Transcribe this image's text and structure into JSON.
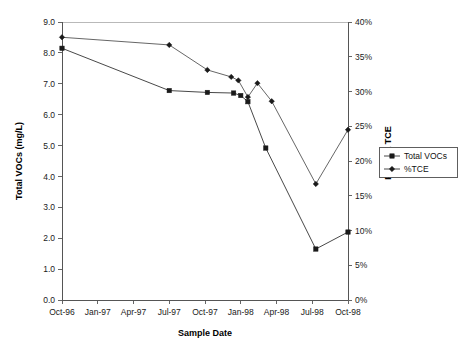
{
  "chart_data": {
    "type": "line",
    "title": "",
    "xlabel": "Sample Date",
    "ylabel": "Total VOCs (mg/L)",
    "y2label": "Percent TCE",
    "grid": "top-border-only",
    "legend_position": "right-outside-middle",
    "x_categories": [
      "Oct-96",
      "Jan-97",
      "Apr-97",
      "Jul-97",
      "Oct-97",
      "Jan-98",
      "Apr-98",
      "Jul-98",
      "Oct-98"
    ],
    "x_tick_labels": [
      "Oct-96",
      "Jan-97",
      "Apr-97",
      "Jul-97",
      "Oct-97",
      "Jan-98",
      "Apr-98",
      "Jul-98",
      "Oct-98"
    ],
    "y_tick_labels": [
      "0.0",
      "1.0",
      "2.0",
      "3.0",
      "4.0",
      "5.0",
      "6.0",
      "7.0",
      "8.0",
      "9.0"
    ],
    "y_tick_values": [
      0.0,
      1.0,
      2.0,
      3.0,
      4.0,
      5.0,
      6.0,
      7.0,
      8.0,
      9.0
    ],
    "ylim": [
      0.0,
      9.0
    ],
    "y2_tick_labels": [
      "0%",
      "5%",
      "10%",
      "15%",
      "20%",
      "25%",
      "30%",
      "35%",
      "40%"
    ],
    "y2_tick_values": [
      0,
      5,
      10,
      15,
      20,
      25,
      30,
      35,
      40
    ],
    "y2lim": [
      0,
      40
    ],
    "xlim_months": [
      0,
      24
    ],
    "series": [
      {
        "name": "Total VOCs",
        "axis": "left",
        "marker": "square",
        "color": "#1a1a1a",
        "points": [
          {
            "x_label": "Oct-96",
            "x_month": 0.0,
            "value": 8.15
          },
          {
            "x_label": "Jul-97",
            "x_month": 9.0,
            "value": 6.78
          },
          {
            "x_label": "Oct-97",
            "x_month": 12.2,
            "value": 6.72
          },
          {
            "x_label": "Jan-98",
            "x_month": 14.4,
            "value": 6.7
          },
          {
            "x_label": "Feb-98",
            "x_month": 15.0,
            "value": 6.62
          },
          {
            "x_label": "Mar-98",
            "x_month": 15.6,
            "value": 6.42
          },
          {
            "x_label": "Apr-98",
            "x_month": 17.1,
            "value": 4.92
          },
          {
            "x_label": "Jul-98",
            "x_month": 21.3,
            "value": 1.65
          },
          {
            "x_label": "Oct-98",
            "x_month": 24.0,
            "value": 2.2
          }
        ]
      },
      {
        "name": "%TCE",
        "axis": "right",
        "marker": "diamond",
        "color": "#1a1a1a",
        "points": [
          {
            "x_label": "Oct-96",
            "x_month": 0.0,
            "value": 37.8
          },
          {
            "x_label": "Jul-97",
            "x_month": 9.0,
            "value": 36.7
          },
          {
            "x_label": "Oct-97",
            "x_month": 12.2,
            "value": 33.1
          },
          {
            "x_label": "Jan-98",
            "x_month": 14.2,
            "value": 32.1
          },
          {
            "x_label": "Feb-98",
            "x_month": 14.8,
            "value": 31.6
          },
          {
            "x_label": "Mar-98",
            "x_month": 15.6,
            "value": 29.2
          },
          {
            "x_label": "Apr-98",
            "x_month": 16.4,
            "value": 31.2
          },
          {
            "x_label": "May-98",
            "x_month": 17.6,
            "value": 28.6
          },
          {
            "x_label": "Jul-98",
            "x_month": 21.3,
            "value": 16.7
          },
          {
            "x_label": "Oct-98",
            "x_month": 24.0,
            "value": 24.5
          }
        ]
      }
    ],
    "legend_entries": [
      {
        "label": "Total VOCs",
        "marker": "square"
      },
      {
        "label": "%TCE",
        "marker": "diamond"
      }
    ]
  }
}
